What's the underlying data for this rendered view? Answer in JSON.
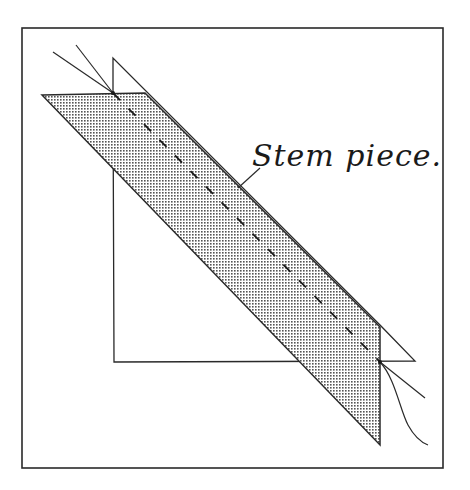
{
  "figure": {
    "type": "quilt-block-construction-diagram",
    "label": "Stem piece.",
    "colors": {
      "line": "#2a2a2a",
      "stem_fill": "#c9c9c9",
      "background": "#ffffff"
    }
  }
}
